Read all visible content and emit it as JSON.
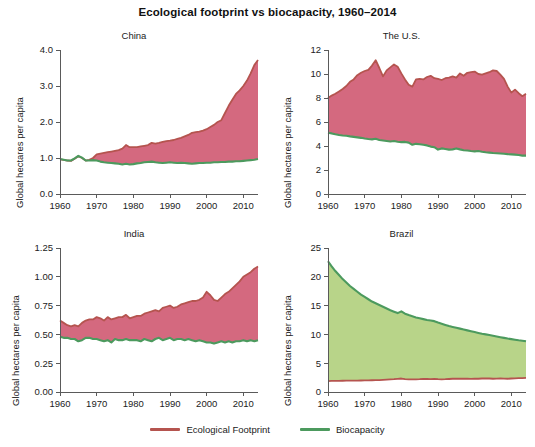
{
  "chart_data": {
    "type": "area",
    "title": "Ecological footprint vs biocapacity, 1960–2014",
    "xlabel": "",
    "ylabel": "Global hectares per capita",
    "grid": false,
    "legend_position": "bottom-center",
    "x_start": 1960,
    "x_end": 2014,
    "xlim": [
      1960,
      2014
    ],
    "xticks": [
      1960,
      1970,
      1980,
      1990,
      2000,
      2010
    ],
    "xticklabels": [
      "1960",
      "1970",
      "1980",
      "1990",
      "2000",
      "2010"
    ],
    "colors": {
      "footprint_line": "#b5544f",
      "footprint_fill": "#d4697f",
      "biocapacity_line": "#4c9a5e",
      "biocapacity_fill": "#b8d489",
      "axis": "#5a5a5a",
      "text": "#222222",
      "background": "#ffffff"
    },
    "legend": [
      {
        "name": "Ecological Footprint",
        "color": "#b5544f"
      },
      {
        "name": "Biocapacity",
        "color": "#4c9a5e"
      }
    ],
    "panels": [
      {
        "key": "china",
        "title": "China",
        "ylabel": "Global hectares per capita",
        "ylim": [
          0.0,
          4.0
        ],
        "yticks": [
          0.0,
          1.0,
          2.0,
          3.0,
          4.0
        ],
        "yticklabels": [
          "0.0",
          "1.0",
          "2.0",
          "3.0",
          "4.0"
        ],
        "fill_above": "footprint",
        "series": [
          {
            "name": "Ecological Footprint",
            "values": [
              0.96,
              0.95,
              0.93,
              0.92,
              0.98,
              1.05,
              1.0,
              0.93,
              0.95,
              1.0,
              1.1,
              1.12,
              1.14,
              1.16,
              1.18,
              1.2,
              1.22,
              1.26,
              1.36,
              1.3,
              1.3,
              1.3,
              1.32,
              1.34,
              1.36,
              1.42,
              1.4,
              1.42,
              1.45,
              1.47,
              1.48,
              1.5,
              1.53,
              1.56,
              1.6,
              1.64,
              1.7,
              1.72,
              1.73,
              1.76,
              1.8,
              1.86,
              1.92,
              2.0,
              2.05,
              2.25,
              2.45,
              2.62,
              2.78,
              2.88,
              3.0,
              3.15,
              3.35,
              3.58,
              3.72
            ]
          },
          {
            "name": "Biocapacity",
            "values": [
              0.97,
              0.95,
              0.93,
              0.93,
              0.99,
              1.06,
              1.01,
              0.93,
              0.93,
              0.94,
              0.93,
              0.9,
              0.88,
              0.87,
              0.86,
              0.85,
              0.84,
              0.82,
              0.84,
              0.82,
              0.83,
              0.85,
              0.86,
              0.88,
              0.89,
              0.9,
              0.88,
              0.87,
              0.86,
              0.87,
              0.88,
              0.87,
              0.86,
              0.87,
              0.86,
              0.85,
              0.84,
              0.85,
              0.86,
              0.86,
              0.87,
              0.87,
              0.88,
              0.88,
              0.89,
              0.89,
              0.9,
              0.9,
              0.91,
              0.91,
              0.92,
              0.93,
              0.94,
              0.95,
              0.97
            ]
          }
        ]
      },
      {
        "key": "us",
        "title": "The U.S.",
        "ylabel": "Global hectares per capita",
        "ylim": [
          0,
          12
        ],
        "yticks": [
          0,
          2,
          4,
          6,
          8,
          10,
          12
        ],
        "yticklabels": [
          "0",
          "2",
          "4",
          "6",
          "8",
          "10",
          "12"
        ],
        "fill_above": "footprint",
        "series": [
          {
            "name": "Ecological Footprint",
            "values": [
              8.0,
              8.2,
              8.35,
              8.55,
              8.75,
              9.0,
              9.35,
              9.55,
              9.9,
              10.1,
              10.25,
              10.35,
              10.7,
              11.15,
              10.5,
              9.8,
              10.3,
              10.55,
              10.8,
              10.6,
              10.05,
              9.55,
              9.1,
              8.95,
              9.55,
              9.6,
              9.55,
              9.75,
              9.85,
              9.65,
              9.6,
              9.5,
              9.65,
              9.7,
              9.8,
              9.7,
              10.05,
              9.85,
              10.1,
              10.15,
              10.2,
              10.0,
              9.95,
              10.05,
              10.15,
              10.3,
              10.25,
              9.95,
              9.6,
              8.95,
              8.45,
              8.7,
              8.4,
              8.15,
              8.35
            ]
          },
          {
            "name": "Biocapacity",
            "values": [
              5.1,
              5.05,
              4.98,
              4.92,
              4.88,
              4.85,
              4.8,
              4.76,
              4.72,
              4.68,
              4.62,
              4.58,
              4.55,
              4.6,
              4.5,
              4.46,
              4.42,
              4.38,
              4.42,
              4.36,
              4.32,
              4.34,
              4.28,
              4.1,
              4.18,
              4.15,
              4.1,
              4.05,
              3.95,
              3.9,
              3.7,
              3.8,
              3.75,
              3.7,
              3.72,
              3.8,
              3.72,
              3.65,
              3.62,
              3.58,
              3.55,
              3.58,
              3.52,
              3.48,
              3.45,
              3.42,
              3.4,
              3.38,
              3.35,
              3.32,
              3.3,
              3.28,
              3.25,
              3.2,
              3.2
            ]
          }
        ]
      },
      {
        "key": "india",
        "title": "India",
        "ylabel": "Global hectares per capita",
        "ylim": [
          0.0,
          1.25
        ],
        "yticks": [
          0.0,
          0.25,
          0.5,
          0.75,
          1.0,
          1.25
        ],
        "yticklabels": [
          "0.00",
          "0.25",
          "0.50",
          "0.75",
          "1.00",
          "1.25"
        ],
        "fill_above": "footprint",
        "series": [
          {
            "name": "Ecological Footprint",
            "values": [
              0.62,
              0.6,
              0.58,
              0.57,
              0.58,
              0.57,
              0.6,
              0.62,
              0.63,
              0.63,
              0.65,
              0.64,
              0.62,
              0.65,
              0.63,
              0.64,
              0.65,
              0.65,
              0.67,
              0.64,
              0.65,
              0.66,
              0.66,
              0.68,
              0.69,
              0.7,
              0.71,
              0.7,
              0.73,
              0.74,
              0.75,
              0.73,
              0.74,
              0.76,
              0.77,
              0.78,
              0.79,
              0.79,
              0.8,
              0.82,
              0.87,
              0.84,
              0.8,
              0.79,
              0.82,
              0.85,
              0.87,
              0.9,
              0.93,
              0.96,
              1.0,
              1.02,
              1.04,
              1.07,
              1.09
            ]
          },
          {
            "name": "Biocapacity",
            "values": [
              0.48,
              0.47,
              0.47,
              0.46,
              0.46,
              0.44,
              0.45,
              0.47,
              0.47,
              0.46,
              0.46,
              0.45,
              0.44,
              0.45,
              0.43,
              0.46,
              0.45,
              0.45,
              0.46,
              0.45,
              0.45,
              0.45,
              0.44,
              0.46,
              0.45,
              0.44,
              0.46,
              0.47,
              0.45,
              0.46,
              0.47,
              0.45,
              0.46,
              0.46,
              0.45,
              0.46,
              0.45,
              0.44,
              0.45,
              0.44,
              0.43,
              0.43,
              0.42,
              0.43,
              0.44,
              0.43,
              0.44,
              0.43,
              0.44,
              0.44,
              0.45,
              0.44,
              0.45,
              0.44,
              0.45
            ]
          }
        ]
      },
      {
        "key": "brazil",
        "title": "Brazil",
        "ylabel": "Global hectares per capita",
        "ylim": [
          0,
          25
        ],
        "yticks": [
          0,
          5,
          10,
          15,
          20,
          25
        ],
        "yticklabels": [
          "0",
          "5",
          "10",
          "15",
          "20",
          "25"
        ],
        "fill_above": "biocapacity",
        "series": [
          {
            "name": "Ecological Footprint",
            "values": [
              1.9,
              1.92,
              1.93,
              1.94,
              1.95,
              1.96,
              1.97,
              1.98,
              1.99,
              2.0,
              2.01,
              2.02,
              2.04,
              2.05,
              2.07,
              2.1,
              2.14,
              2.18,
              2.22,
              2.28,
              2.34,
              2.22,
              2.2,
              2.18,
              2.2,
              2.22,
              2.26,
              2.28,
              2.24,
              2.26,
              2.22,
              2.2,
              2.22,
              2.26,
              2.3,
              2.32,
              2.3,
              2.32,
              2.3,
              2.28,
              2.32,
              2.3,
              2.34,
              2.38,
              2.34,
              2.3,
              2.32,
              2.34,
              2.32,
              2.3,
              2.34,
              2.38,
              2.4,
              2.42,
              2.45
            ]
          },
          {
            "name": "Biocapacity",
            "values": [
              22.7,
              21.8,
              21.0,
              20.3,
              19.6,
              19.0,
              18.4,
              17.9,
              17.4,
              16.9,
              16.5,
              16.1,
              15.7,
              15.4,
              15.1,
              14.8,
              14.5,
              14.2,
              13.95,
              13.7,
              14.0,
              13.6,
              13.35,
              13.15,
              12.95,
              12.8,
              12.65,
              12.5,
              12.4,
              12.3,
              12.05,
              11.85,
              11.65,
              11.45,
              11.3,
              11.15,
              11.0,
              10.85,
              10.7,
              10.55,
              10.4,
              10.25,
              10.1,
              10.0,
              9.9,
              9.78,
              9.65,
              9.52,
              9.4,
              9.28,
              9.18,
              9.08,
              8.98,
              8.9,
              8.8
            ]
          }
        ]
      }
    ]
  }
}
